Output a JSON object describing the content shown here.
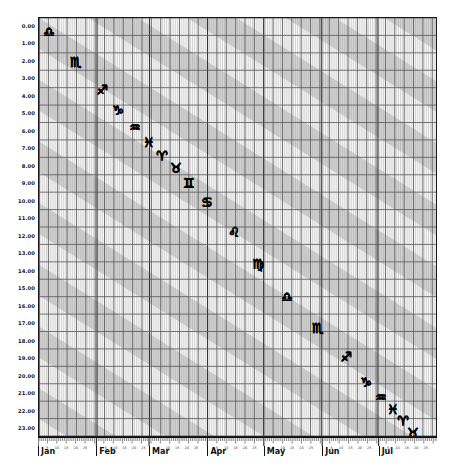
{
  "chart_data": {
    "type": "scatter",
    "title": "",
    "subtitle": "",
    "xlabel": "",
    "ylabel": "",
    "x_axis": {
      "type": "date",
      "months": [
        "Jan",
        "Feb",
        "Mar",
        "Apr",
        "May",
        "Jun",
        "Jul"
      ],
      "month_start_days": [
        0,
        31,
        59,
        90,
        120,
        151,
        181
      ],
      "day_ticks": [
        5,
        10,
        15,
        20,
        25
      ],
      "range_days": [
        0,
        212
      ],
      "tick_interval_days": 1
    },
    "y_axis": {
      "label_format": "H.00",
      "ticks": [
        "0.00",
        "1.00",
        "2.00",
        "3.00",
        "4.00",
        "5.00",
        "6.00",
        "7.00",
        "8.00",
        "9.00",
        "10.00",
        "11.00",
        "12.00",
        "13.00",
        "14.00",
        "15.00",
        "16.00",
        "17.00",
        "18.00",
        "19.00",
        "20.00",
        "21.00",
        "22.00",
        "23.00"
      ],
      "values": [
        0,
        1,
        2,
        3,
        4,
        5,
        6,
        7,
        8,
        9,
        10,
        11,
        12,
        13,
        14,
        15,
        16,
        17,
        18,
        19,
        20,
        21,
        22,
        23
      ],
      "range": [
        0,
        23
      ],
      "direction": "descending"
    },
    "grid": {
      "vertical": true,
      "horizontal": true,
      "minor_vertical": true,
      "color": "#555555",
      "minor_color": "#999999"
    },
    "bands": {
      "description": "alternating diagonal shaded bands",
      "fill": "#d8d8d8",
      "gap_fill": "#ffffff",
      "angle_deg": 32,
      "period_px": 62,
      "band_width_px": 31
    },
    "legend": {
      "position": "none",
      "entries": []
    },
    "series": [
      {
        "name": "zodiac-signs",
        "marker": "zodiac-glyph",
        "points": [
          {
            "glyph": "♎",
            "sign": "Libra",
            "x_px": 48,
            "y_px": 31,
            "month": "Jan",
            "hour": "0.40"
          },
          {
            "glyph": "♏",
            "sign": "Scorpio",
            "x_px": 75,
            "y_px": 61,
            "month": "Jan",
            "hour": "2.10"
          },
          {
            "glyph": "♐",
            "sign": "Sagittarius",
            "x_px": 101,
            "y_px": 89,
            "month": "Jan",
            "hour": "3.70"
          },
          {
            "glyph": "♑",
            "sign": "Capricorn",
            "x_px": 117,
            "y_px": 109,
            "month": "Feb",
            "hour": "4.80"
          },
          {
            "glyph": "♒",
            "sign": "Aquarius",
            "x_px": 134,
            "y_px": 126,
            "month": "Feb",
            "hour": "5.80"
          },
          {
            "glyph": "♓",
            "sign": "Pisces",
            "x_px": 148,
            "y_px": 141,
            "month": "Feb",
            "hour": "6.60"
          },
          {
            "glyph": "♈",
            "sign": "Aries",
            "x_px": 161,
            "y_px": 155,
            "month": "Feb",
            "hour": "7.40"
          },
          {
            "glyph": "♉",
            "sign": "Taurus",
            "x_px": 175,
            "y_px": 167,
            "month": "Feb",
            "hour": "8.10"
          },
          {
            "glyph": "♊",
            "sign": "Gemini",
            "x_px": 188,
            "y_px": 182,
            "month": "Mar",
            "hour": "9.00"
          },
          {
            "glyph": "♋",
            "sign": "Cancer",
            "x_px": 206,
            "y_px": 201,
            "month": "Mar",
            "hour": "10.00"
          },
          {
            "glyph": "♌",
            "sign": "Leo",
            "x_px": 233,
            "y_px": 231,
            "month": "Mar",
            "hour": "11.80"
          },
          {
            "glyph": "♍",
            "sign": "Virgo",
            "x_px": 257,
            "y_px": 263,
            "month": "Apr",
            "hour": "13.50"
          },
          {
            "glyph": "♎",
            "sign": "Libra",
            "x_px": 286,
            "y_px": 296,
            "month": "Apr",
            "hour": "15.40"
          },
          {
            "glyph": "♏",
            "sign": "Scorpio",
            "x_px": 317,
            "y_px": 327,
            "month": "May",
            "hour": "17.20"
          },
          {
            "glyph": "♐",
            "sign": "Sagittarius",
            "x_px": 345,
            "y_px": 356,
            "month": "Jun",
            "hour": "18.80"
          },
          {
            "glyph": "♑",
            "sign": "Capricorn",
            "x_px": 365,
            "y_px": 381,
            "month": "Jun",
            "hour": "20.30"
          },
          {
            "glyph": "♒",
            "sign": "Aquarius",
            "x_px": 380,
            "y_px": 396,
            "month": "Jun",
            "hour": "21.10"
          },
          {
            "glyph": "♓",
            "sign": "Pisces",
            "x_px": 392,
            "y_px": 408,
            "month": "Jul",
            "hour": "21.80"
          },
          {
            "glyph": "♈",
            "sign": "Aries",
            "x_px": 402,
            "y_px": 420,
            "month": "Jul",
            "hour": "22.50"
          },
          {
            "glyph": "♉",
            "sign": "Taurus",
            "x_px": 412,
            "y_px": 432,
            "month": "Jul",
            "hour": "23.20"
          }
        ]
      }
    ]
  }
}
